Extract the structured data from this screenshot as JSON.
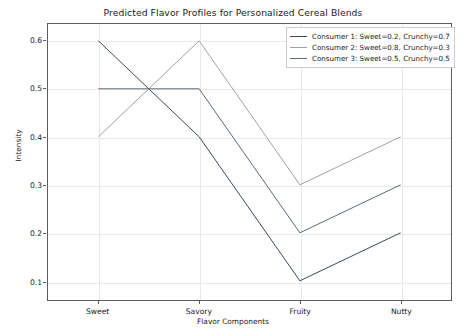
{
  "chart_data": {
    "type": "line",
    "title": "Predicted Flavor Profiles for Personalized Cereal Blends",
    "xlabel": "Flavor Components",
    "ylabel": "Intensity",
    "categories": [
      "Sweet",
      "Savory",
      "Fruity",
      "Nutty"
    ],
    "yticks": [
      "0.1",
      "0.2",
      "0.3",
      "0.4",
      "0.5",
      "0.6"
    ],
    "ylim": [
      0.06,
      0.635
    ],
    "grid": true,
    "legend_position": "upper right",
    "series": [
      {
        "name": "Consumer 1: Sweet=0.2, Crunchy=0.7",
        "color": "#3b4a54",
        "values": [
          0.6,
          0.4,
          0.1,
          0.2
        ]
      },
      {
        "name": "Consumer 2: Sweet=0.8, Crunchy=0.3",
        "color": "#9aa3a8",
        "values": [
          0.4,
          0.6,
          0.3,
          0.4
        ]
      },
      {
        "name": "Consumer 3: Sweet=0.5, Crunchy=0.5",
        "color": "#5c6a73",
        "values": [
          0.5,
          0.5,
          0.2,
          0.3
        ]
      }
    ]
  }
}
